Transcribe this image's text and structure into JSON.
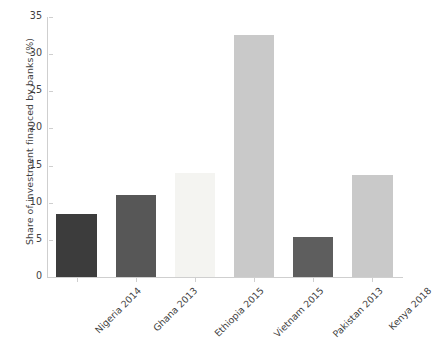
{
  "chart_data": {
    "type": "bar",
    "title": "",
    "xlabel": "",
    "ylabel": "Share of investment financed by banks (%)",
    "categories": [
      "Nigeria 2014",
      "Ghana 2013",
      "Ethiopia 2015",
      "Vietnam 2015",
      "Pakistan 2013",
      "Kenya 2018"
    ],
    "values": [
      8.5,
      11.0,
      14.0,
      32.6,
      5.4,
      13.8
    ],
    "bar_colors": [
      "#3c3c3c",
      "#575757",
      "#f4f4f1",
      "#c9c9c9",
      "#5e5e5e",
      "#c9c9c9"
    ],
    "ylim": [
      0,
      35
    ],
    "yticks": [
      0,
      5,
      10,
      15,
      20,
      25,
      30,
      35
    ],
    "ytick_labels": [
      "0",
      "5",
      "10",
      "15",
      "20",
      "25",
      "30",
      "35"
    ],
    "grid": false,
    "legend": "none",
    "xtick_rotation": -45
  },
  "axes": {
    "spine_color": "#cfcfcf",
    "tick_color": "#cfcfcf",
    "text_color": "#3f3f3f"
  }
}
